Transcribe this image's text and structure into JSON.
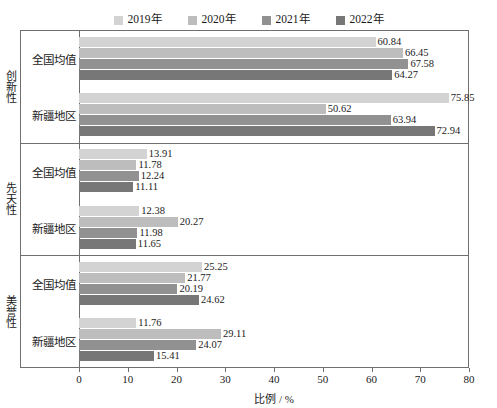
{
  "chart_data": {
    "type": "bar",
    "orientation": "horizontal",
    "title": "",
    "subtitle": "",
    "xlabel": "比例 / %",
    "ylabel": "",
    "xlim": [
      0,
      80
    ],
    "xticks": [
      0,
      10,
      20,
      30,
      40,
      50,
      60,
      70,
      80
    ],
    "grid": false,
    "legend_position": "top-center",
    "legend": [
      "2019年",
      "2020年",
      "2021年",
      "2022年"
    ],
    "series": [
      {
        "name": "2019年",
        "color": "#d3d3d3",
        "values": [
          60.84,
          75.85,
          13.91,
          12.38,
          25.25,
          11.76
        ]
      },
      {
        "name": "2020年",
        "color": "#bdbdbd",
        "values": [
          66.45,
          50.62,
          11.78,
          20.27,
          21.77,
          29.11
        ]
      },
      {
        "name": "2021年",
        "color": "#919191",
        "values": [
          67.58,
          63.94,
          12.24,
          11.98,
          20.19,
          24.07
        ]
      },
      {
        "name": "2022年",
        "color": "#777777",
        "values": [
          64.27,
          72.94,
          11.11,
          11.65,
          24.62,
          15.41
        ]
      }
    ],
    "categories": [
      "创新性 - 全国均值",
      "创新性 - 新疆地区",
      "先天性 - 全国均值",
      "先天性 - 新疆地区",
      "美誉性 - 全国均值",
      "美誉性 - 新疆地区"
    ],
    "groups": [
      {
        "axis_label": "创新性",
        "subgroups": [
          {
            "label": "全国均值",
            "bars": [
              {
                "year": "2019年",
                "value": 60.84,
                "value_label": "60.84",
                "color": "#d3d3d3"
              },
              {
                "year": "2020年",
                "value": 66.45,
                "value_label": "66.45",
                "color": "#bdbdbd"
              },
              {
                "year": "2021年",
                "value": 67.58,
                "value_label": "67.58",
                "color": "#919191"
              },
              {
                "year": "2022年",
                "value": 64.27,
                "value_label": "64.27",
                "color": "#777777"
              }
            ]
          },
          {
            "label": "新疆地区",
            "bars": [
              {
                "year": "2019年",
                "value": 75.85,
                "value_label": "75.85",
                "color": "#d3d3d3"
              },
              {
                "year": "2020年",
                "value": 50.62,
                "value_label": "50.62",
                "color": "#bdbdbd"
              },
              {
                "year": "2021年",
                "value": 63.94,
                "value_label": "63.94",
                "color": "#919191"
              },
              {
                "year": "2022年",
                "value": 72.94,
                "value_label": "72.94",
                "color": "#777777"
              }
            ]
          }
        ]
      },
      {
        "axis_label": "先天性",
        "subgroups": [
          {
            "label": "全国均值",
            "bars": [
              {
                "year": "2019年",
                "value": 13.91,
                "value_label": "13.91",
                "color": "#d3d3d3"
              },
              {
                "year": "2020年",
                "value": 11.78,
                "value_label": "11.78",
                "color": "#bdbdbd"
              },
              {
                "year": "2021年",
                "value": 12.24,
                "value_label": "12.24",
                "color": "#919191"
              },
              {
                "year": "2022年",
                "value": 11.11,
                "value_label": "11.11",
                "color": "#777777"
              }
            ]
          },
          {
            "label": "新疆地区",
            "bars": [
              {
                "year": "2019年",
                "value": 12.38,
                "value_label": "12.38",
                "color": "#d3d3d3"
              },
              {
                "year": "2020年",
                "value": 20.27,
                "value_label": "20.27",
                "color": "#bdbdbd"
              },
              {
                "year": "2021年",
                "value": 11.98,
                "value_label": "11.98",
                "color": "#919191"
              },
              {
                "year": "2022年",
                "value": 11.65,
                "value_label": "11.65",
                "color": "#777777"
              }
            ]
          }
        ]
      },
      {
        "axis_label": "美誉性",
        "subgroups": [
          {
            "label": "全国均值",
            "bars": [
              {
                "year": "2019年",
                "value": 25.25,
                "value_label": "25.25",
                "color": "#d3d3d3"
              },
              {
                "year": "2020年",
                "value": 21.77,
                "value_label": "21.77",
                "color": "#bdbdbd"
              },
              {
                "year": "2021年",
                "value": 20.19,
                "value_label": "20.19",
                "color": "#919191"
              },
              {
                "year": "2022年",
                "value": 24.62,
                "value_label": "24.62",
                "color": "#777777"
              }
            ]
          },
          {
            "label": "新疆地区",
            "bars": [
              {
                "year": "2019年",
                "value": 11.76,
                "value_label": "11.76",
                "color": "#d3d3d3"
              },
              {
                "year": "2020年",
                "value": 29.11,
                "value_label": "29.11",
                "color": "#bdbdbd"
              },
              {
                "year": "2021年",
                "value": 24.07,
                "value_label": "24.07",
                "color": "#919191"
              },
              {
                "year": "2022年",
                "value": 15.41,
                "value_label": "15.41",
                "color": "#777777"
              }
            ]
          }
        ]
      }
    ]
  },
  "axis": {
    "x_title": "比例 / %",
    "x_tick_labels": [
      "0",
      "10",
      "20",
      "30",
      "40",
      "50",
      "60",
      "70",
      "80"
    ]
  },
  "colors": {
    "axis": "#6f6f6f",
    "text": "#1a1a1a",
    "background": "#ffffff"
  }
}
